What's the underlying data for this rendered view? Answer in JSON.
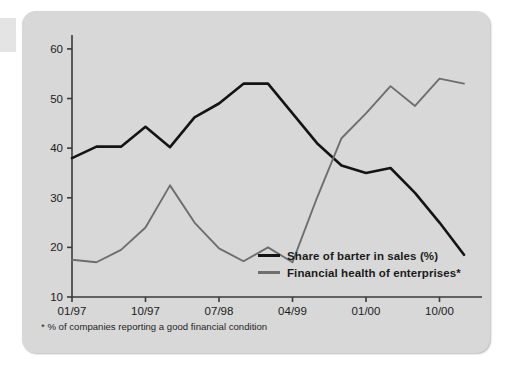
{
  "figure": {
    "background_color": "#d8d8d8",
    "page_color": "#ffffff",
    "footnote": "* % of companies reporting a good financial condition"
  },
  "legend": {
    "position": "inside-bottom-center",
    "entries": [
      {
        "label": "Share of barter in sales (%)",
        "color": "#141414",
        "icon": "line-swatch"
      },
      {
        "label": "Financial health of enterprises*",
        "color": "#6e6e6e",
        "icon": "line-swatch"
      }
    ]
  },
  "chart_data": {
    "type": "line",
    "title": "",
    "subtitle": "",
    "xlabel": "",
    "ylabel": "",
    "grid": false,
    "legend_position": "inside-bottom-center",
    "ylim": [
      10,
      62
    ],
    "yticks": [
      10,
      20,
      30,
      40,
      50,
      60
    ],
    "ytick_labels": [
      "10",
      "20",
      "30",
      "40",
      "50",
      "60"
    ],
    "xticks": [
      "01/97",
      "10/97",
      "07/98",
      "04/99",
      "01/00",
      "10/00"
    ],
    "xtick_labels": [
      "01/97",
      "10/97",
      "07/98",
      "04/99",
      "01/00",
      "10/00"
    ],
    "x": [
      "01/97",
      "04/97",
      "07/97",
      "10/97",
      "01/98",
      "04/98",
      "07/98",
      "10/98",
      "01/99",
      "04/99",
      "07/99",
      "10/99",
      "01/00",
      "04/00",
      "07/00",
      "10/00",
      "01/01"
    ],
    "series": [
      {
        "name": "Share of barter in sales (%)",
        "color": "#141414",
        "values": [
          38.0,
          40.3,
          40.3,
          44.3,
          40.2,
          46.2,
          49.0,
          53.0,
          53.0,
          47.0,
          41.0,
          36.5,
          35.0,
          36.0,
          31.0,
          25.0,
          18.5
        ]
      },
      {
        "name": "Financial health of enterprises*",
        "color": "#6e6e6e",
        "values": [
          17.5,
          17.0,
          19.5,
          24.0,
          32.5,
          25.0,
          19.8,
          17.2,
          20.0,
          17.0,
          30.0,
          42.0,
          47.0,
          52.5,
          48.5,
          54.0,
          53.0
        ]
      }
    ],
    "annotations": [
      {
        "text": "* % of companies reporting a good financial condition",
        "position": "below-axis-left"
      }
    ]
  }
}
